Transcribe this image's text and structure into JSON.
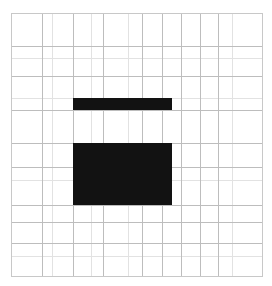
{
  "figure": {
    "background_color": "#ffffff",
    "width": 272,
    "height": 286
  },
  "chart_data": {
    "type": "heatmap",
    "title": "",
    "subtitle": "",
    "xlabel": "",
    "ylabel": "",
    "grid": true,
    "legend": null,
    "axis_frame": {
      "x_min": 11,
      "x_max": 262,
      "y_min": 13,
      "y_max": 276,
      "line_color": "#c8c8c8",
      "line_width": 1
    },
    "grid_lines": {
      "color_major": "#bdbdbd",
      "color_minor": "#e2e2e2",
      "vertical_x": [
        11,
        42,
        52,
        73,
        91,
        103,
        128,
        142,
        162,
        181,
        200,
        218,
        232,
        262
      ],
      "horizontal_y": [
        13,
        46,
        58,
        76,
        98,
        110,
        143,
        167,
        180,
        205,
        222,
        243,
        256,
        276
      ]
    },
    "cells": [
      {
        "name": "upper-bar",
        "x": 73,
        "y": 98,
        "width": 99,
        "height": 12,
        "color": "#121212",
        "value": 1
      },
      {
        "name": "lower-block",
        "x": 73,
        "y": 143,
        "width": 99,
        "height": 62,
        "color": "#121212",
        "value": 1
      }
    ],
    "values_legend": {
      "filled": 1,
      "empty": 0
    },
    "xlim": [
      11,
      262
    ],
    "ylim": [
      13,
      276
    ]
  }
}
